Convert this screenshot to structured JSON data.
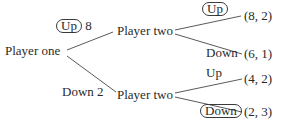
{
  "diagram": {
    "type": "game-tree",
    "root": {
      "label": "Player one",
      "branches": [
        {
          "move": "Up",
          "circled": true,
          "payoff_value": "8",
          "node": {
            "label": "Player two",
            "branches": [
              {
                "move": "Up",
                "circled": true,
                "outcome": "(8, 2)"
              },
              {
                "move": "Down",
                "circled": false,
                "outcome": "(6, 1)"
              }
            ]
          }
        },
        {
          "move": "Down",
          "circled": false,
          "payoff_value": "2",
          "node": {
            "label": "Player two",
            "branches": [
              {
                "move": "Up",
                "circled": false,
                "outcome": "(4, 2)"
              },
              {
                "move": "Down",
                "circled": true,
                "outcome": "(2, 3)"
              }
            ]
          }
        }
      ]
    }
  },
  "colors": {
    "text": "#2a2a2a",
    "line": "#5a5a5a",
    "background": "#ffffff"
  }
}
